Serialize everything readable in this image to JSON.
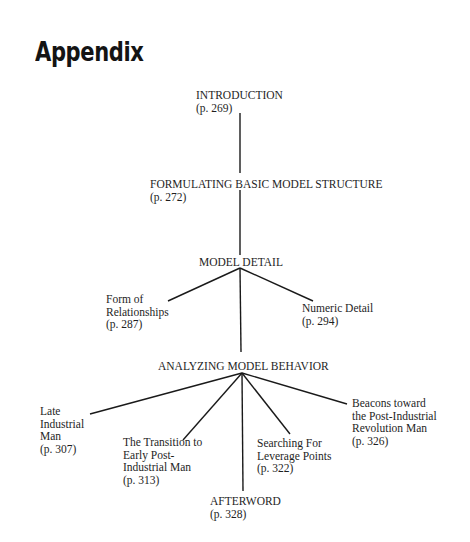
{
  "title": "Appendix",
  "nodes": {
    "introduction": {
      "label": "INTRODUCTION",
      "page": "(p. 269)"
    },
    "formulating": {
      "label": "FORMULATING BASIC MODEL STRUCTURE",
      "page": "(p. 272)"
    },
    "model_detail": {
      "label": "MODEL DETAIL"
    },
    "form_of_relationships": {
      "lines": [
        "Form of",
        "Relationships"
      ],
      "page": "(p. 287)"
    },
    "numeric_detail": {
      "label": "Numeric Detail",
      "page": "(p. 294)"
    },
    "analyzing": {
      "label": "ANALYZING MODEL BEHAVIOR"
    },
    "late_industrial": {
      "lines": [
        "Late",
        "Industrial",
        "Man"
      ],
      "page": "(p. 307)"
    },
    "transition": {
      "lines": [
        "The Transition to",
        "Early Post-",
        "Industrial Man"
      ],
      "page": "(p. 313)"
    },
    "searching": {
      "lines": [
        "Searching For",
        "Leverage Points"
      ],
      "page": "(p. 322)"
    },
    "beacons": {
      "lines": [
        "Beacons toward",
        "the Post-Industrial",
        "Revolution Man"
      ],
      "page": "(p. 326)"
    },
    "afterword": {
      "label": "AFTERWORD",
      "page": "(p. 328)"
    }
  },
  "edges": [
    [
      "INTRODUCTION",
      "FORMULATING BASIC MODEL STRUCTURE"
    ],
    [
      "FORMULATING BASIC MODEL STRUCTURE",
      "MODEL DETAIL"
    ],
    [
      "MODEL DETAIL",
      "Form of Relationships"
    ],
    [
      "MODEL DETAIL",
      "Numeric Detail"
    ],
    [
      "MODEL DETAIL",
      "ANALYZING MODEL BEHAVIOR"
    ],
    [
      "ANALYZING MODEL BEHAVIOR",
      "Late Industrial Man"
    ],
    [
      "ANALYZING MODEL BEHAVIOR",
      "The Transition to Early Post-Industrial Man"
    ],
    [
      "ANALYZING MODEL BEHAVIOR",
      "AFTERWORD"
    ],
    [
      "ANALYZING MODEL BEHAVIOR",
      "Searching For Leverage Points"
    ],
    [
      "ANALYZING MODEL BEHAVIOR",
      "Beacons toward the Post-Industrial Revolution Man"
    ]
  ]
}
